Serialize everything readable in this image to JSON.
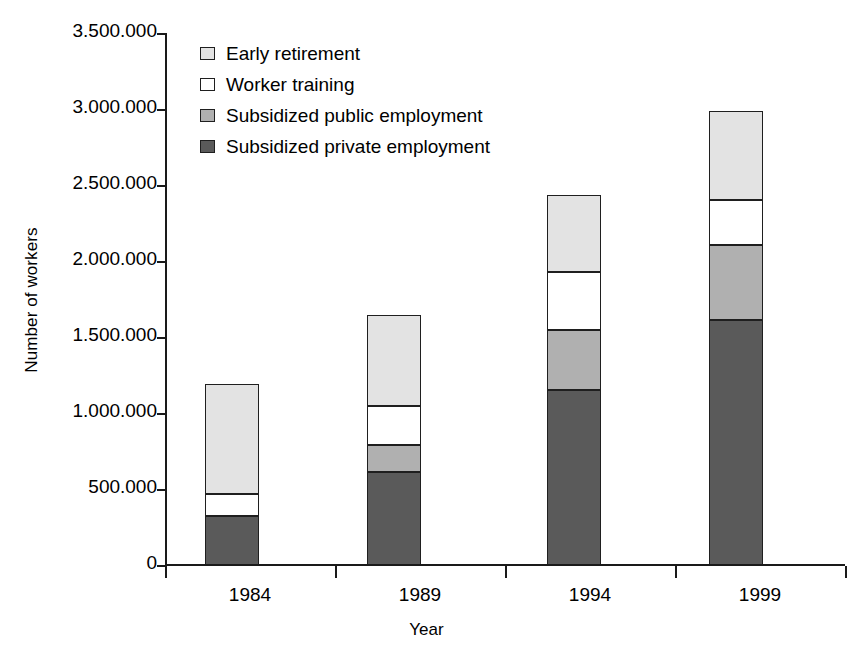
{
  "chart_data": {
    "type": "bar",
    "subtype": "stacked-bar",
    "title": "",
    "xlabel": "Year",
    "ylabel": "Number of workers",
    "categories": [
      "1984",
      "1989",
      "1994",
      "1999"
    ],
    "ylim": [
      0,
      3500000
    ],
    "ytick_labels": [
      "3.500.000",
      "3.000.000",
      "2.500.000",
      "2.000.000",
      "1.500.000",
      "1.000.000",
      "500.000",
      "0"
    ],
    "ytick_values": [
      3500000,
      3000000,
      2500000,
      2000000,
      1500000,
      1000000,
      500000,
      0
    ],
    "ytick_step": 500000,
    "number_format": "european-dot-thousands",
    "grid": false,
    "legend_position": "top-left-inside",
    "stack_order_bottom_to_top": [
      "Subsidized private employment",
      "Subsidized public employment",
      "Worker training",
      "Early retirement"
    ],
    "series": [
      {
        "name": "Early retirement",
        "color": "#e3e3e3",
        "values": [
          720000,
          600000,
          505000,
          590000
        ]
      },
      {
        "name": "Worker training",
        "color": "#ffffff",
        "values": [
          150000,
          255000,
          385000,
          295000
        ]
      },
      {
        "name": "Subsidized public employment",
        "color": "#b0b0b0",
        "values": [
          0,
          180000,
          395000,
          495000
        ]
      },
      {
        "name": "Subsidized private employment",
        "color": "#5a5a5a",
        "values": [
          320000,
          610000,
          1150000,
          1610000
        ]
      }
    ],
    "totals": [
      1190000,
      1645000,
      2435000,
      2990000
    ]
  },
  "legend": {
    "items": [
      {
        "label": "Early retirement",
        "color": "#e3e3e3"
      },
      {
        "label": "Worker training",
        "color": "#ffffff"
      },
      {
        "label": "Subsidized public employment",
        "color": "#b0b0b0"
      },
      {
        "label": "Subsidized private employment",
        "color": "#5a5a5a"
      }
    ]
  },
  "axes": {
    "y_title": "Number of workers",
    "x_title": "Year"
  }
}
